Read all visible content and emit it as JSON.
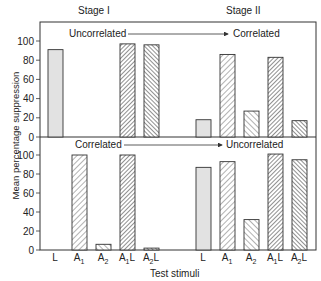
{
  "chart_data": [
    {
      "type": "bar",
      "panel": "top",
      "title": "Stage I",
      "annotation": "Uncorrelated",
      "categories": [
        "L",
        "A1",
        "A2",
        "A1L",
        "A2L"
      ],
      "values": [
        91,
        0,
        0,
        97,
        96
      ],
      "xlabel": "Test stimuli",
      "ylabel": "Mean percentage suppression",
      "ylim": [
        0,
        100
      ],
      "yticks": [
        0,
        20,
        40,
        60,
        80,
        100
      ]
    },
    {
      "type": "bar",
      "panel": "top",
      "title": "Stage II",
      "annotation": "Correlated",
      "categories": [
        "L",
        "A1",
        "A2",
        "A1L",
        "A2L"
      ],
      "values": [
        18,
        86,
        27,
        83,
        17
      ],
      "xlabel": "Test stimuli",
      "ylabel": "Mean percentage suppression",
      "ylim": [
        0,
        100
      ]
    },
    {
      "type": "bar",
      "panel": "bottom",
      "title": "Stage I",
      "annotation": "Correlated",
      "categories": [
        "L",
        "A1",
        "A2",
        "A1L",
        "A2L"
      ],
      "values": [
        0,
        100,
        6,
        100,
        2
      ],
      "xlabel": "Test stimuli",
      "ylabel": "Mean percentage suppression",
      "ylim": [
        0,
        100
      ],
      "yticks": [
        0,
        20,
        40,
        60,
        80,
        100
      ]
    },
    {
      "type": "bar",
      "panel": "bottom",
      "title": "Stage II",
      "annotation": "Uncorrelated",
      "categories": [
        "L",
        "A1",
        "A2",
        "A1L",
        "A2L"
      ],
      "values": [
        87,
        93,
        32,
        101,
        95
      ],
      "xlabel": "Test stimuli",
      "ylabel": "Mean percentage suppression",
      "ylim": [
        0,
        100
      ]
    }
  ],
  "figure": {
    "stage1_title": "Stage I",
    "stage2_title": "Stage II",
    "top_left_annotation": "Uncorrelated",
    "top_right_annotation": "Correlated",
    "bottom_left_annotation": "Correlated",
    "bottom_right_annotation": "Uncorrelated",
    "ylabel": "Mean percentage suppression",
    "xlabel": "Test stimuli",
    "yticks": [
      "0",
      "20",
      "40",
      "60",
      "80",
      "100"
    ],
    "x_labels": [
      "L",
      "A1",
      "A2",
      "A1L",
      "A2L",
      "L",
      "A1",
      "A2",
      "A1L",
      "A2L"
    ]
  },
  "colors": {
    "frame": "#333333",
    "L_fill": "#e2e2e2",
    "hatch": "#444444"
  }
}
